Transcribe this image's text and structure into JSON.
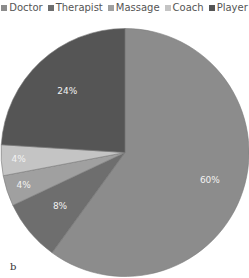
{
  "chart_data": {
    "type": "pie",
    "title": "",
    "categories": [
      "Doctor",
      "Therapist",
      "Massage",
      "Coach",
      "Player"
    ],
    "values": [
      60,
      8,
      4,
      4,
      24
    ],
    "labels": [
      "60%",
      "8%",
      "4%",
      "4%",
      "24%"
    ],
    "colors": [
      "#8c8c8c",
      "#6e6e6e",
      "#a0a0a0",
      "#c4c4c4",
      "#555555"
    ],
    "legend_position": "top",
    "start_angle_deg": 0,
    "direction": "clockwise"
  },
  "legend": [
    {
      "label": "Doctor",
      "color": "#8c8c8c"
    },
    {
      "label": "Therapist",
      "color": "#6e6e6e"
    },
    {
      "label": "Massage",
      "color": "#a0a0a0"
    },
    {
      "label": "Coach",
      "color": "#c4c4c4"
    },
    {
      "label": "Player",
      "color": "#555555"
    }
  ],
  "panel_label": "b"
}
